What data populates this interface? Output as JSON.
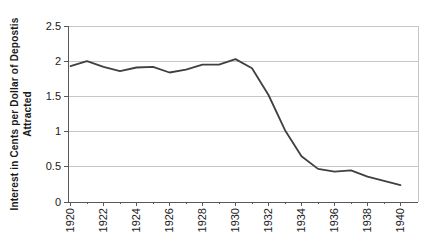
{
  "chart_data": {
    "type": "line",
    "title": "",
    "ylabel_line1": "Interest in Cents per Dollar of Depostis",
    "ylabel_line2": "Attracted",
    "xlabel": "",
    "x": [
      1920,
      1921,
      1922,
      1923,
      1924,
      1925,
      1926,
      1927,
      1928,
      1929,
      1930,
      1931,
      1932,
      1933,
      1934,
      1935,
      1936,
      1937,
      1938,
      1939,
      1940
    ],
    "values": [
      1.93,
      2.0,
      1.92,
      1.86,
      1.91,
      1.92,
      1.84,
      1.88,
      1.95,
      1.95,
      2.03,
      1.9,
      1.52,
      1.02,
      0.65,
      0.47,
      0.43,
      0.45,
      0.36,
      0.3,
      0.24
    ],
    "x_tick_labels": [
      "1920",
      "1922",
      "1924",
      "1926",
      "1928",
      "1930",
      "1932",
      "1934",
      "1936",
      "1938",
      "1940"
    ],
    "y_tick_labels": [
      "0",
      "0.5",
      "1",
      "1.5",
      "2",
      "2.5"
    ],
    "ylim": [
      0,
      2.5
    ],
    "y_step": 0.5,
    "grid": true,
    "legend": "none",
    "line_color": "#404040",
    "grid_color": "#c6c6c6",
    "axis_color": "#595959"
  }
}
